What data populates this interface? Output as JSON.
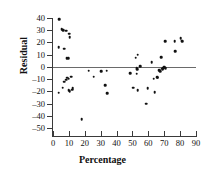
{
  "chart_data": {
    "type": "scatter",
    "title": "",
    "xlabel": "Percentage",
    "ylabel": "Residual",
    "xlim": [
      0,
      90
    ],
    "ylim": [
      -50,
      40
    ],
    "xticks": [
      0,
      10,
      20,
      30,
      40,
      50,
      60,
      70,
      80,
      90
    ],
    "yticks": [
      40,
      30,
      20,
      10,
      0,
      -10,
      -20,
      -30,
      -40,
      -50
    ],
    "grid": false,
    "legend": null,
    "reference_line": {
      "orientation": "horizontal",
      "value": 0,
      "color": "#6a6a6a"
    },
    "marker": {
      "shape": "circle",
      "color": "#111111",
      "size": 2.6
    },
    "points": [
      [
        4.0,
        39.0
      ],
      [
        3.5,
        16.0
      ],
      [
        3.6,
        -21.0
      ],
      [
        5.6,
        31.0
      ],
      [
        6.2,
        30.5
      ],
      [
        6.6,
        30.0
      ],
      [
        7.0,
        15.0
      ],
      [
        7.2,
        -12.0
      ],
      [
        6.0,
        -17.0
      ],
      [
        8.2,
        29.5
      ],
      [
        8.6,
        7.0
      ],
      [
        8.8,
        -9.0
      ],
      [
        8.4,
        -10.5
      ],
      [
        9.6,
        7.2
      ],
      [
        9.8,
        -9.5
      ],
      [
        10.2,
        27.0
      ],
      [
        10.6,
        24.5
      ],
      [
        10.0,
        -19.0
      ],
      [
        10.4,
        -20.0
      ],
      [
        11.6,
        -8.0
      ],
      [
        12.0,
        -18.5
      ],
      [
        12.4,
        -17.5
      ],
      [
        18.0,
        -43.0
      ],
      [
        22.5,
        -3.0
      ],
      [
        25.5,
        -8.0
      ],
      [
        30.5,
        -3.5
      ],
      [
        33.0,
        -15.0
      ],
      [
        33.8,
        -3.0
      ],
      [
        34.0,
        -21.5
      ],
      [
        48.5,
        -5.0
      ],
      [
        50.5,
        -17.0
      ],
      [
        52.0,
        7.5
      ],
      [
        52.6,
        -5.5
      ],
      [
        52.8,
        -1.0
      ],
      [
        53.0,
        -2.0
      ],
      [
        53.4,
        10.0
      ],
      [
        53.2,
        -19.0
      ],
      [
        55.0,
        0.5
      ],
      [
        58.5,
        -30.0
      ],
      [
        59.5,
        -17.5
      ],
      [
        62.0,
        4.0
      ],
      [
        63.5,
        -9.5
      ],
      [
        64.0,
        -20.5
      ],
      [
        65.5,
        -8.5
      ],
      [
        66.0,
        -9.0
      ],
      [
        67.0,
        -2.5
      ],
      [
        67.4,
        -3.5
      ],
      [
        68.0,
        8.0
      ],
      [
        68.4,
        -1.5
      ],
      [
        69.0,
        -2.0
      ],
      [
        69.4,
        -1.0
      ],
      [
        70.0,
        0.0
      ],
      [
        70.4,
        -0.5
      ],
      [
        70.8,
        21.0
      ],
      [
        71.0,
        -1.0
      ],
      [
        76.5,
        21.0
      ],
      [
        77.0,
        13.0
      ],
      [
        80.5,
        23.5
      ],
      [
        81.0,
        21.5
      ],
      [
        81.2,
        21.0
      ]
    ]
  }
}
